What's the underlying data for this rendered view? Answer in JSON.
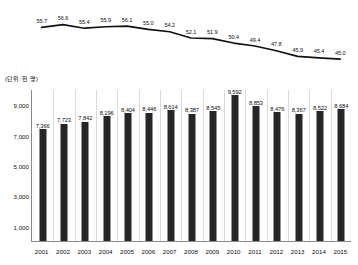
{
  "chart_data": {
    "type": "bar",
    "title": "",
    "subtitle": "",
    "unit_label": "(단위: 천 명)",
    "xlabel": "",
    "ylabel": "",
    "categories": [
      "2001",
      "2002",
      "2003",
      "2004",
      "2005",
      "2006",
      "2007",
      "2008",
      "2009",
      "2010",
      "2011",
      "2012",
      "2013",
      "2014",
      "2015"
    ],
    "ylim": [
      0,
      10000
    ],
    "yticks": [
      "1,000",
      "3,000",
      "5,000",
      "7,000",
      "9,000"
    ],
    "ytick_values": [
      1000,
      3000,
      5000,
      7000,
      9000
    ],
    "grid": true,
    "legend": "none",
    "series": [
      {
        "name": "bars",
        "type": "bar",
        "values": [
          7366,
          7723,
          7842,
          8196,
          8404,
          8446,
          8614,
          8387,
          8545,
          9592,
          8853,
          8476,
          8367,
          8522,
          8684
        ],
        "labels": [
          "7,366",
          "7,723",
          "7,842",
          "8,196",
          "8,404",
          "8,446",
          "8,614",
          "8,387",
          "8,545",
          "9,592",
          "8,853",
          "8,476",
          "8,367",
          "8,522",
          "8,684"
        ],
        "color": "#262626"
      },
      {
        "name": "line",
        "type": "line",
        "values": [
          55.7,
          56.6,
          55.4,
          55.9,
          56.1,
          55.0,
          54.2,
          52.1,
          51.9,
          50.4,
          49.4,
          47.8,
          45.9,
          45.4,
          45.0
        ],
        "labels": [
          "55.7",
          "56.6",
          "55.4",
          "55.9",
          "56.1",
          "55.0",
          "54.2",
          "52.1",
          "51.9",
          "50.4",
          "49.4",
          "47.8",
          "45.9",
          "45.4",
          "45.0"
        ],
        "ylim": [
          44.0,
          57.5
        ],
        "color": "#111111"
      }
    ]
  }
}
